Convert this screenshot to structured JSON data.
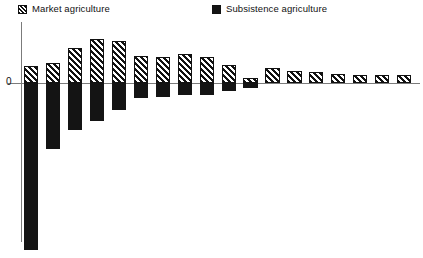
{
  "legend": {
    "entries": [
      {
        "label": "Market agriculture",
        "swatch": "hatch-diagonal-swatch",
        "color": "#111111"
      },
      {
        "label": "Subsistence agriculture",
        "swatch": "solid-black-swatch",
        "color": "#141414"
      }
    ]
  },
  "axis": {
    "zero_label": "0"
  },
  "chart_data": {
    "type": "bar",
    "title": "",
    "subtitle": "",
    "xlabel": "",
    "ylabel": "",
    "orientation": "vertical",
    "stacked": false,
    "grid": false,
    "legend_position": "top",
    "axis_ranges": {
      "y_zero_baseline": 0,
      "ylim": [
        -11.1,
        3.8
      ],
      "note": "Values expressed in arbitrary chart units; only the 0 baseline is labeled."
    },
    "categories": [
      "1",
      "2",
      "3",
      "4",
      "5",
      "6",
      "7",
      "8",
      "9",
      "10",
      "11",
      "12",
      "13",
      "14",
      "15",
      "16",
      "17",
      "18"
    ],
    "series": [
      {
        "name": "Market agriculture",
        "swatch": "hatch-diagonal-swatch",
        "color": "#111111",
        "values": [
          1.1,
          1.3,
          2.3,
          2.9,
          2.8,
          1.8,
          1.7,
          1.9,
          1.7,
          1.2,
          0.3,
          1.0,
          0.8,
          0.7,
          0.6,
          0.5,
          0.5,
          0.5
        ]
      },
      {
        "name": "Subsistence agriculture",
        "swatch": "solid-black-swatch",
        "color": "#141414",
        "values": [
          -11.1,
          -4.4,
          -3.1,
          -2.5,
          -1.8,
          -1.0,
          -0.9,
          -0.8,
          -0.8,
          -0.5,
          -0.3,
          0.0,
          0.0,
          0.0,
          0.0,
          0.0,
          0.0,
          0.0
        ]
      }
    ]
  }
}
